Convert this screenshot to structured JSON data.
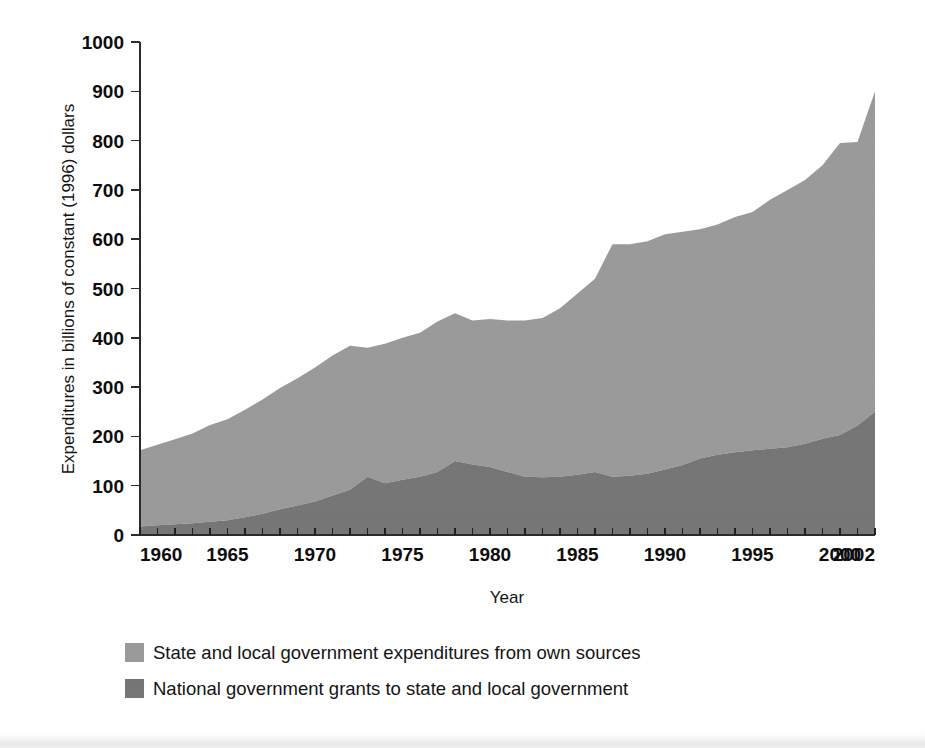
{
  "figure": {
    "background_color": "#ffffff"
  },
  "chart_data": {
    "type": "area",
    "stacked": true,
    "title": "",
    "subtitle": "",
    "xlabel": "Year",
    "ylabel": "Expenditures in billions of constant (1996) dollars",
    "xlim": [
      1960,
      2002
    ],
    "ylim": [
      0,
      1000
    ],
    "grid": false,
    "legend_position": "below-plot-left",
    "y_ticks": [
      0,
      100,
      200,
      300,
      400,
      500,
      600,
      700,
      800,
      900,
      1000
    ],
    "y_tick_labels": [
      "0",
      "100",
      "200",
      "300",
      "400",
      "500",
      "600",
      "700",
      "800",
      "900",
      "1000"
    ],
    "x_ticks": [
      1960,
      1965,
      1970,
      1975,
      1980,
      1985,
      1990,
      1995,
      2000,
      2002
    ],
    "x_tick_labels": [
      "1960",
      "1965",
      "1970",
      "1975",
      "1980",
      "1985",
      "1990",
      "1995",
      "2000",
      "2002"
    ],
    "x_minor_tick_interval": 1,
    "x": [
      1960,
      1961,
      1962,
      1963,
      1964,
      1965,
      1966,
      1967,
      1968,
      1969,
      1970,
      1971,
      1972,
      1973,
      1974,
      1975,
      1976,
      1977,
      1978,
      1979,
      1980,
      1981,
      1982,
      1983,
      1984,
      1985,
      1986,
      1987,
      1988,
      1989,
      1990,
      1991,
      1992,
      1993,
      1994,
      1995,
      1996,
      1997,
      1998,
      1999,
      2000,
      2001,
      2002
    ],
    "series": [
      {
        "name": "National government grants to state and local government",
        "color": "#767676",
        "stack_order": 1,
        "values": [
          17,
          20,
          22,
          24,
          27,
          30,
          36,
          43,
          52,
          60,
          68,
          80,
          92,
          118,
          105,
          112,
          118,
          128,
          150,
          143,
          138,
          128,
          118,
          117,
          118,
          122,
          128,
          118,
          120,
          124,
          133,
          142,
          155,
          163,
          168,
          172,
          175,
          178,
          185,
          195,
          203,
          222,
          250
        ]
      },
      {
        "name": "State and local government expenditures from own sources",
        "color": "#9a9a9a",
        "stack_order": 2,
        "values": [
          155,
          163,
          172,
          182,
          196,
          205,
          218,
          232,
          246,
          258,
          272,
          284,
          292,
          262,
          283,
          288,
          292,
          305,
          300,
          292,
          300,
          307,
          317,
          323,
          342,
          368,
          392,
          472,
          470,
          472,
          477,
          473,
          465,
          467,
          477,
          483,
          505,
          522,
          535,
          555,
          592,
          575,
          650
        ]
      }
    ],
    "totals": [
      172,
      183,
      194,
      206,
      223,
      235,
      254,
      275,
      298,
      318,
      340,
      364,
      384,
      380,
      388,
      400,
      410,
      433,
      450,
      435,
      438,
      435,
      435,
      440,
      460,
      490,
      520,
      590,
      590,
      596,
      610,
      615,
      620,
      630,
      645,
      655,
      680,
      700,
      720,
      750,
      795,
      797,
      900
    ]
  },
  "legend": {
    "items": [
      {
        "label": "State and local government expenditures from own sources",
        "swatch_color": "#9a9a9a"
      },
      {
        "label": "National government grants to state and local government",
        "swatch_color": "#767676"
      }
    ]
  }
}
